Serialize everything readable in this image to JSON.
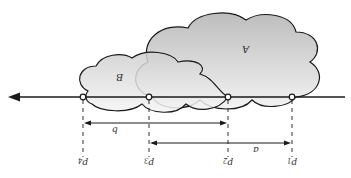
{
  "diagram": {
    "orientation": "rotated-180",
    "regions": [
      {
        "id": "A",
        "label": "A",
        "fill_top": "#c4c4c4",
        "fill_bottom": "#f4f4f4"
      },
      {
        "id": "B",
        "label": "B",
        "fill_top": "#d2d2d2",
        "fill_bottom": "#f6f6f6"
      }
    ],
    "points": [
      {
        "id": "p1",
        "label": "p",
        "sub": "1"
      },
      {
        "id": "p2",
        "label": "p",
        "sub": "2"
      },
      {
        "id": "p3",
        "label": "p",
        "sub": "3"
      },
      {
        "id": "p4",
        "label": "p",
        "sub": "4"
      }
    ],
    "dimensions": [
      {
        "id": "a",
        "label": "a",
        "from": "p3",
        "to": "p1"
      },
      {
        "id": "b",
        "label": "b",
        "from": "p4",
        "to": "p2"
      }
    ],
    "colors": {
      "stroke": "#1a1a1a",
      "text": "#333333",
      "background": "#ffffff"
    }
  }
}
